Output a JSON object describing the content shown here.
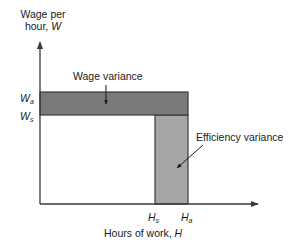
{
  "diagram": {
    "y_axis_label_line1": "Wage per",
    "y_axis_label_line2": "hour, ",
    "y_axis_var": "W",
    "x_axis_label": "Hours of work, ",
    "x_axis_var": "H",
    "y_ticks": [
      {
        "base": "W",
        "sub": "a"
      },
      {
        "base": "W",
        "sub": "s"
      }
    ],
    "x_ticks": [
      {
        "base": "H",
        "sub": "s"
      },
      {
        "base": "H",
        "sub": "a"
      }
    ],
    "annotations": {
      "wage_variance": "Wage variance",
      "efficiency_variance": "Efficiency variance"
    },
    "colors": {
      "wage_variance_fill": "#7a7a7a",
      "efficiency_variance_fill": "#a6a6a6",
      "axis": "#3a3a3a"
    }
  }
}
